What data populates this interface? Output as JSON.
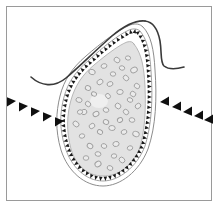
{
  "figure": {
    "title": "",
    "caption": "",
    "domain_kind": "biological-micrograph-illustration",
    "canvas": {
      "width": 220,
      "height": 208,
      "background": "#ffffff"
    },
    "frame": {
      "name": "figure-border",
      "x": 6,
      "y": 6,
      "width": 205,
      "height": 194,
      "stroke": "#9a9a9a",
      "stroke_width": 1,
      "fill": "#ffffff"
    },
    "colors": {
      "frame_stroke": "#9a9a9a",
      "outer_contour": "#3a3a3a",
      "capsule_outline": "#8c8c8c",
      "membrane_spikes": "#1a1a1a",
      "cytoplasm_fill": "#e2e2e2",
      "cytoplasm_edge": "#a8a8a8",
      "vesicle_stroke": "#9e9e9e",
      "nucleus_fill": "#f0f0f0",
      "arrowhead_fill": "#101010",
      "background": "#ffffff"
    },
    "structures": [
      {
        "name": "outer-tissue-contour-left",
        "description": "dark wavy line sweeping in from the left margin, dipping then rising to the cell apex",
        "stroke": "#3a3a3a",
        "stroke_width": 1.6,
        "path": "M 31 77 C 41 86, 54 88, 66 78 C 80 66, 96 50, 112 36 C 124 26, 136 20, 145 21"
      },
      {
        "name": "outer-tissue-contour-right",
        "description": "dark line continuing over the apex and curving down and out to the right margin",
        "stroke": "#3a3a3a",
        "stroke_width": 1.6,
        "path": "M 145 21 C 153 22, 158 30, 160 41 C 162 53, 160 62, 164 66 C 169 70, 177 69, 184 67"
      },
      {
        "name": "capsule-outline-outer",
        "description": "thin gray teardrop capsule wall enclosing the cell",
        "stroke": "#8c8c8c",
        "stroke_width": 1,
        "fill": "none",
        "path": "M 143 27 C 151 35, 154 50, 155 70 C 157 98, 156 126, 148 149 C 139 172, 120 186, 103 186 C 85 186, 68 172, 61 150 C 55 130, 56 112, 60 96 C 64 80, 72 68, 86 56 C 101 43, 118 30, 130 25 C 136 23, 140 24, 143 27 Z"
      },
      {
        "name": "capsule-outline-inner",
        "description": "second thin gray wall just inside the outer capsule",
        "stroke": "#9a9a9a",
        "stroke_width": 0.9,
        "fill": "none",
        "path": "M 140 31 C 147 39, 150 52, 151 71 C 153 97, 152 124, 145 146 C 137 167, 119 181, 103 181 C 86 181, 71 167, 65 147 C 59 128, 60 112, 64 97 C 68 82, 76 71, 89 60 C 103 47, 118 35, 129 30 C 134 28, 138 29, 140 31 Z"
      },
      {
        "name": "cytoplasm-body",
        "description": "light gray granular cytoplasm fill of the cell",
        "fill": "#e2e2e2",
        "stroke": "#a8a8a8",
        "stroke_width": 0.8,
        "path": "M 134 44 C 142 54, 144 68, 145 86 C 146 110, 145 132, 139 150 C 132 167, 118 176, 103 176 C 88 176, 76 166, 71 149 C 66 131, 67 114, 71 100 C 75 86, 82 75, 94 65 C 106 55, 119 45, 127 42 C 131 41, 133 42, 134 44 Z"
      },
      {
        "name": "nucleus-pale-region",
        "description": "slightly paler rounded region in the mid-left of the cytoplasm",
        "fill": "#efefef",
        "cx": 99,
        "cy": 101,
        "rx": 9,
        "ry": 7
      }
    ],
    "membrane_spikes": {
      "name": "membrane-spike-border",
      "description": "ring of small solid black triangles around the cell membrane, pointing inward",
      "count": 74,
      "fill": "#1a1a1a",
      "size": 4.2
    },
    "vesicles": {
      "name": "cytoplasmic-vesicles",
      "description": "scattered small irregular gray-outlined ellipses inside the cytoplasm",
      "count": 46,
      "stroke": "#9e9e9e",
      "stroke_width": 0.9,
      "fill": "#ebebeb",
      "points": [
        [
          92,
          72,
          3.3,
          2.6,
          20
        ],
        [
          104,
          66,
          2.9,
          2.3,
          -15
        ],
        [
          117,
          60,
          3.1,
          2.5,
          35
        ],
        [
          128,
          58,
          2.6,
          2.1,
          10
        ],
        [
          134,
          70,
          3.4,
          2.7,
          -25
        ],
        [
          126,
          78,
          3.0,
          2.4,
          45
        ],
        [
          113,
          74,
          2.7,
          2.2,
          5
        ],
        [
          100,
          82,
          3.2,
          2.5,
          -35
        ],
        [
          88,
          88,
          2.8,
          2.3,
          25
        ],
        [
          79,
          100,
          3.1,
          2.4,
          15
        ],
        [
          84,
          112,
          2.9,
          2.6,
          -20
        ],
        [
          76,
          124,
          3.3,
          2.5,
          40
        ],
        [
          82,
          136,
          2.7,
          2.2,
          -10
        ],
        [
          90,
          146,
          3.0,
          2.4,
          30
        ],
        [
          86,
          158,
          2.8,
          2.3,
          0
        ],
        [
          98,
          164,
          3.2,
          2.6,
          -30
        ],
        [
          110,
          168,
          2.9,
          2.3,
          20
        ],
        [
          122,
          160,
          3.1,
          2.5,
          45
        ],
        [
          130,
          148,
          2.7,
          2.2,
          -15
        ],
        [
          136,
          134,
          3.3,
          2.6,
          25
        ],
        [
          132,
          120,
          2.8,
          2.3,
          10
        ],
        [
          138,
          106,
          3.0,
          2.4,
          -40
        ],
        [
          133,
          94,
          2.9,
          2.5,
          35
        ],
        [
          120,
          92,
          3.2,
          2.5,
          -5
        ],
        [
          108,
          96,
          2.7,
          2.2,
          50
        ],
        [
          96,
          114,
          3.1,
          2.4,
          -25
        ],
        [
          106,
          110,
          2.8,
          2.3,
          15
        ],
        [
          118,
          106,
          3.0,
          2.6,
          40
        ],
        [
          124,
          132,
          2.9,
          2.3,
          -20
        ],
        [
          112,
          128,
          3.2,
          2.5,
          5
        ],
        [
          100,
          132,
          2.7,
          2.2,
          30
        ],
        [
          92,
          126,
          3.0,
          2.4,
          -35
        ],
        [
          104,
          146,
          2.8,
          2.3,
          20
        ],
        [
          116,
          144,
          3.1,
          2.5,
          -10
        ],
        [
          126,
          112,
          2.9,
          2.4,
          45
        ],
        [
          94,
          94,
          2.6,
          2.1,
          25
        ],
        [
          110,
          84,
          3.0,
          2.3,
          -20
        ],
        [
          122,
          68,
          2.7,
          2.2,
          15
        ],
        [
          137,
          86,
          2.9,
          2.4,
          35
        ],
        [
          80,
          112,
          2.6,
          2.2,
          -15
        ],
        [
          98,
          154,
          2.9,
          2.3,
          10
        ],
        [
          120,
          120,
          2.7,
          2.3,
          -30
        ],
        [
          130,
          100,
          2.8,
          2.2,
          20
        ],
        [
          88,
          104,
          2.9,
          2.4,
          40
        ],
        [
          114,
          156,
          2.7,
          2.2,
          -5
        ],
        [
          106,
          122,
          2.8,
          2.3,
          25
        ]
      ]
    },
    "annotations": {
      "arrow_clusters": [
        {
          "name": "arrowhead-cluster-left",
          "label": "",
          "description": "five solid black arrowheads in a descending diagonal row pointing right toward the cell",
          "direction": "right-down",
          "count": 5,
          "fill": "#101010",
          "points": [
            [
              16,
              101,
              0
            ],
            [
              28,
              106,
              0
            ],
            [
              40,
              111,
              0
            ],
            [
              52,
              116,
              0
            ],
            [
              64,
              121,
              0
            ]
          ],
          "size": 9
        },
        {
          "name": "arrowhead-cluster-right",
          "label": "",
          "description": "five solid black arrowheads in an ascending diagonal row pointing left toward the cell",
          "direction": "left-up",
          "count": 5,
          "fill": "#101010",
          "points": [
            [
              160,
              102,
              180
            ],
            [
              172,
              107,
              180
            ],
            [
              183,
              112,
              180
            ],
            [
              194,
              116,
              180
            ],
            [
              204,
              120,
              180
            ]
          ],
          "size": 9
        }
      ]
    }
  }
}
